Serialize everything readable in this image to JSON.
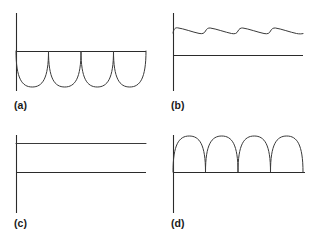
{
  "figure": {
    "title": "",
    "background_color": "#ffffff",
    "stroke_color": "#3a3a3a",
    "axis_color": "#2b2b2b",
    "width": 314,
    "height": 244
  },
  "panels": [
    {
      "id": "a",
      "label": "(a)",
      "description": "Inverted full-wave rectified waveform: four downward half-sine lobes hanging below a horizontal zero line",
      "axis": {
        "vertical": {
          "x": 16,
          "y_top": 13,
          "y_bottom": 91
        },
        "horizontal": {
          "y": 51,
          "x_start": 16,
          "x_end": 146
        }
      },
      "waveform": {
        "type": "half-sine",
        "polarity": "negative",
        "lobes": 4,
        "baseline_y": 51,
        "peak_y": 87,
        "amplitude": 36,
        "x_start": 16,
        "x_end": 146,
        "period": 32.5
      }
    },
    {
      "id": "b",
      "label": "(b)",
      "description": "Filtered DC with ripple: small sawtooth ripple riding on a high DC level, with a separate zero reference line below",
      "axis": {
        "vertical": {
          "x": 16,
          "y_top": 13,
          "y_bottom": 91
        },
        "horizontal": {
          "y": 55,
          "x_start": 16,
          "x_end": 146
        }
      },
      "waveform": {
        "type": "ripple",
        "polarity": "positive",
        "lobes": 4,
        "dc_level_y": 28,
        "ripple_trough_y": 33,
        "ripple_amplitude": 5,
        "x_start": 16,
        "x_end": 146,
        "period": 32.5
      }
    },
    {
      "id": "c",
      "label": "(c)",
      "description": "Pure DC: a flat constant level line above a flat zero reference line",
      "axis": {
        "vertical": {
          "x": 16,
          "y_top": 13,
          "y_bottom": 91
        },
        "horizontal": {
          "y": 50,
          "x_start": 16,
          "x_end": 146
        }
      },
      "waveform": {
        "type": "constant",
        "polarity": "positive",
        "lobes": 0,
        "dc_level_y": 21,
        "amplitude": 29,
        "x_start": 16,
        "x_end": 146
      }
    },
    {
      "id": "d",
      "label": "(d)",
      "description": "Full-wave rectified waveform: four upward half-sine lobes rising from a horizontal zero line",
      "axis": {
        "vertical": {
          "x": 16,
          "y_top": 13,
          "y_bottom": 91
        },
        "horizontal": {
          "y": 50,
          "x_start": 16,
          "x_end": 148
        }
      },
      "waveform": {
        "type": "half-sine",
        "polarity": "positive",
        "lobes": 4,
        "baseline_y": 50,
        "peak_y": 14,
        "amplitude": 36,
        "x_start": 16,
        "x_end": 146,
        "period": 32.5
      }
    }
  ]
}
